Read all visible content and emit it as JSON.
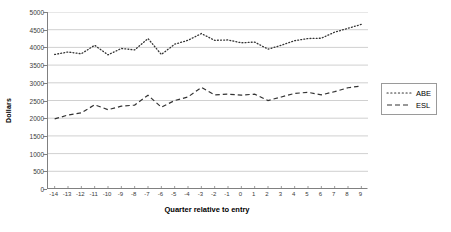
{
  "chart_data": {
    "type": "line",
    "title": "",
    "xlabel": "Quarter relative to entry",
    "ylabel": "Dollars",
    "ylim": [
      0,
      5000
    ],
    "ytick_step": 500,
    "yticks": [
      "5000",
      "4500",
      "4000",
      "3500",
      "3000",
      "2500",
      "2000",
      "1500",
      "1000",
      "500",
      "0"
    ],
    "grid": "horizontal",
    "legend_position": "right",
    "categories": [
      "-14",
      "-13",
      "-12",
      "-11",
      "-10",
      "-9",
      "-8",
      "-7",
      "-6",
      "-5",
      "-4",
      "-3",
      "-2",
      "-1",
      "0",
      "1",
      "2",
      "3",
      "4",
      "5",
      "6",
      "7",
      "8",
      "9"
    ],
    "series": [
      {
        "name": "ABE",
        "style": "dotted",
        "color": "#333333",
        "values": [
          3800,
          3870,
          3820,
          4060,
          3790,
          3970,
          3930,
          4250,
          3800,
          4090,
          4200,
          4390,
          4200,
          4210,
          4130,
          4150,
          3950,
          4060,
          4190,
          4250,
          4260,
          4430,
          4540,
          4650
        ]
      },
      {
        "name": "ESL",
        "style": "dashed",
        "color": "#333333",
        "values": [
          1980,
          2090,
          2150,
          2380,
          2240,
          2340,
          2370,
          2650,
          2310,
          2500,
          2600,
          2870,
          2660,
          2680,
          2650,
          2680,
          2500,
          2600,
          2700,
          2730,
          2660,
          2750,
          2860,
          2910
        ]
      }
    ]
  },
  "legend": {
    "items": [
      {
        "label": "ABE",
        "key": "dotted-line-key"
      },
      {
        "label": "ESL",
        "key": "dashed-line-key"
      }
    ]
  }
}
